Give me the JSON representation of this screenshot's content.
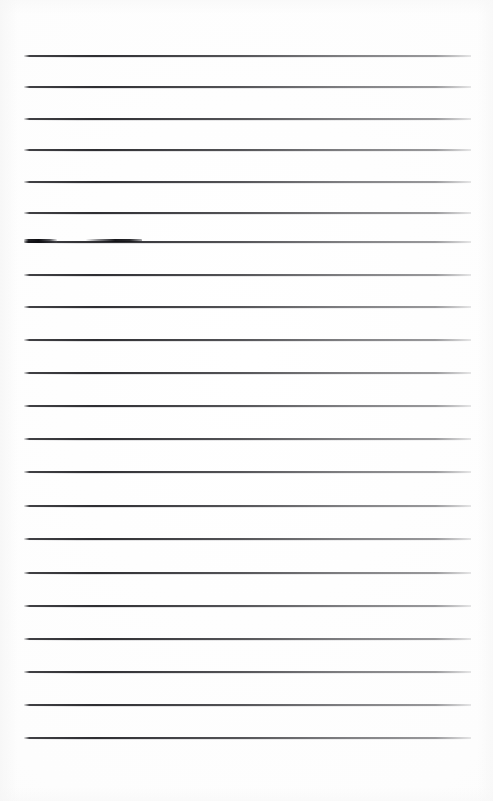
{
  "document": {
    "kind": "scanned-lined-paper",
    "title": "Blank ruled notebook page",
    "page_width": 493,
    "page_height": 801,
    "background_color": "#fdfdfd",
    "rule_color": "#3a3a3e",
    "ink_mark_color": "#131317",
    "text_content": "",
    "visible_text": []
  },
  "ruling": {
    "line_count": 21,
    "left_x": 24,
    "right_x": 471,
    "line_thickness": 2,
    "spacing": 34,
    "first_line_y": 55,
    "lines": [
      {
        "index": 1,
        "y": 55,
        "left": 24,
        "right": 471
      },
      {
        "index": 2,
        "y": 86,
        "left": 24,
        "right": 471
      },
      {
        "index": 3,
        "y": 118,
        "left": 24,
        "right": 471
      },
      {
        "index": 4,
        "y": 149,
        "left": 24,
        "right": 471
      },
      {
        "index": 5,
        "y": 181,
        "left": 24,
        "right": 471
      },
      {
        "index": 6,
        "y": 212,
        "left": 24,
        "right": 471
      },
      {
        "index": 7,
        "y": 241,
        "left": 24,
        "right": 471
      },
      {
        "index": 8,
        "y": 274,
        "left": 24,
        "right": 471
      },
      {
        "index": 9,
        "y": 306,
        "left": 24,
        "right": 471
      },
      {
        "index": 10,
        "y": 339,
        "left": 24,
        "right": 471
      },
      {
        "index": 11,
        "y": 372,
        "left": 24,
        "right": 471
      },
      {
        "index": 12,
        "y": 405,
        "left": 24,
        "right": 471
      },
      {
        "index": 13,
        "y": 438,
        "left": 24,
        "right": 471
      },
      {
        "index": 14,
        "y": 471,
        "left": 24,
        "right": 471
      },
      {
        "index": 15,
        "y": 505,
        "left": 24,
        "right": 471
      },
      {
        "index": 16,
        "y": 538,
        "left": 24,
        "right": 471
      },
      {
        "index": 17,
        "y": 572,
        "left": 24,
        "right": 471
      },
      {
        "index": 18,
        "y": 605,
        "left": 24,
        "right": 471
      },
      {
        "index": 19,
        "y": 638,
        "left": 24,
        "right": 471
      },
      {
        "index": 20,
        "y": 671,
        "left": 24,
        "right": 471
      },
      {
        "index": 21,
        "y": 704,
        "left": 24,
        "right": 471
      },
      {
        "index": 22,
        "y": 737,
        "left": 24,
        "right": 471
      }
    ]
  },
  "artifacts": {
    "ink_marks": [
      {
        "name": "smudge-left",
        "x": 24,
        "y": 239,
        "width": 33,
        "height": 4
      },
      {
        "name": "smudge-right",
        "x": 86,
        "y": 239,
        "width": 56,
        "height": 3
      }
    ]
  }
}
